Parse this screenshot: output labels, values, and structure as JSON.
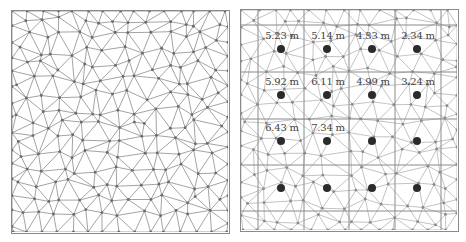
{
  "figure": {
    "left_panel": {
      "description": "Triangular mesh (unstructured)",
      "mesh": {
        "seed": 17,
        "spacing": 17,
        "line_color": "#8c8c8c",
        "node_color": "#6a6a6a"
      }
    },
    "right_panel": {
      "description": "Triangular mesh overlaid with rectangular grid and measurement points",
      "mesh": {
        "seed": 41,
        "spacing": 19,
        "line_color": "#b4b4b4",
        "node_color": "#8a8a8a"
      },
      "grid": {
        "line_color": "#8a8a8a",
        "x_lines": [
          17,
          63,
          108,
          154,
          200
        ],
        "y_lines": [
          15,
          62,
          109,
          155,
          201
        ]
      },
      "stations": [
        {
          "row": 0,
          "col": 0,
          "x": 40,
          "y": 39,
          "label": "5.23 m"
        },
        {
          "row": 0,
          "col": 1,
          "x": 86,
          "y": 39,
          "label": "5.14 m"
        },
        {
          "row": 0,
          "col": 2,
          "x": 131,
          "y": 39,
          "label": "4.33 m"
        },
        {
          "row": 0,
          "col": 3,
          "x": 176,
          "y": 39,
          "label": "2.34 m"
        },
        {
          "row": 1,
          "col": 0,
          "x": 40,
          "y": 85,
          "label": "5.92 m"
        },
        {
          "row": 1,
          "col": 1,
          "x": 86,
          "y": 85,
          "label": "6.11 m"
        },
        {
          "row": 1,
          "col": 2,
          "x": 131,
          "y": 85,
          "label": "4.99 m"
        },
        {
          "row": 1,
          "col": 3,
          "x": 176,
          "y": 85,
          "label": "3.24 m"
        },
        {
          "row": 2,
          "col": 0,
          "x": 40,
          "y": 131,
          "label": "6.43 m"
        },
        {
          "row": 2,
          "col": 1,
          "x": 86,
          "y": 131,
          "label": "7.34 m"
        },
        {
          "row": 2,
          "col": 2,
          "x": 131,
          "y": 131,
          "label": null
        },
        {
          "row": 2,
          "col": 3,
          "x": 176,
          "y": 131,
          "label": null
        },
        {
          "row": 3,
          "col": 0,
          "x": 40,
          "y": 178,
          "label": null
        },
        {
          "row": 3,
          "col": 1,
          "x": 86,
          "y": 178,
          "label": null
        },
        {
          "row": 3,
          "col": 2,
          "x": 131,
          "y": 178,
          "label": null
        },
        {
          "row": 3,
          "col": 3,
          "x": 176,
          "y": 178,
          "label": null
        }
      ]
    }
  }
}
